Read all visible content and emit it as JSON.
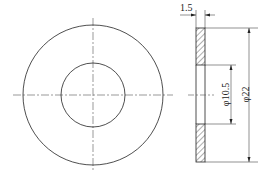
{
  "drawing": {
    "title": "Washer",
    "dimensions": {
      "thickness": "1.5",
      "inner_diameter": "φ10.5",
      "outer_diameter": "φ22"
    },
    "colors": {
      "line": "#222222",
      "background": "#ffffff"
    }
  }
}
